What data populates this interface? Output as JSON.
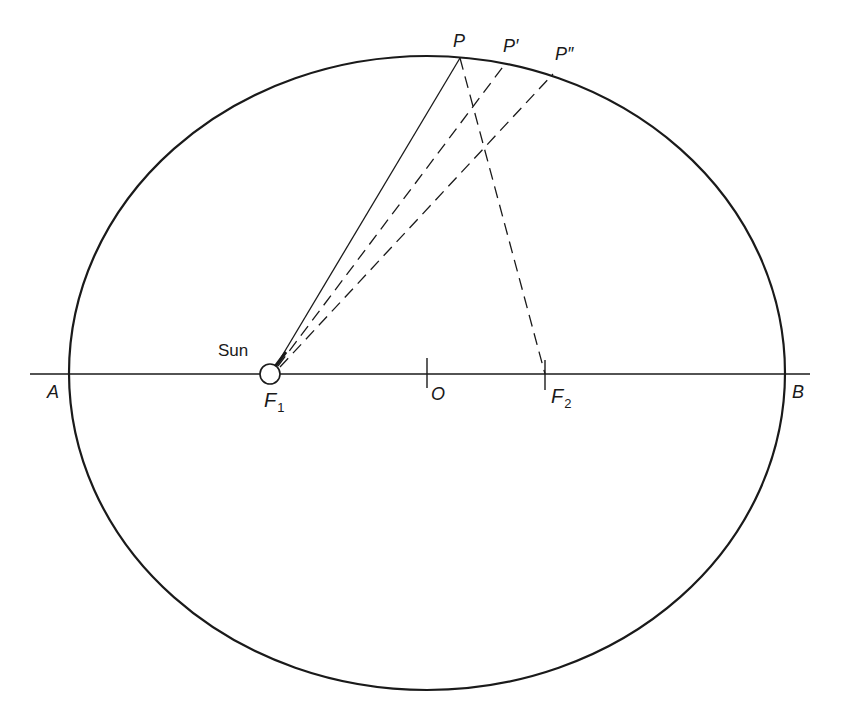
{
  "diagram": {
    "colors": {
      "line": "#1a1a1a",
      "background": "#ffffff"
    },
    "ellipse": {
      "cx": 427,
      "cy": 373,
      "rx": 358,
      "ry": 317
    },
    "axis": {
      "x1": 30,
      "x2": 810,
      "y": 374
    },
    "labels": {
      "sun": "Sun",
      "A": "A",
      "B": "B",
      "O": "O",
      "F1_main": "F",
      "F1_sub": "1",
      "F2_main": "F",
      "F2_sub": "2",
      "P": "P",
      "P1": "P′",
      "P2": "P″"
    },
    "points": {
      "F1": {
        "x": 270,
        "y": 374
      },
      "F2": {
        "x": 545,
        "y": 374
      },
      "O": {
        "x": 427,
        "y": 374
      },
      "P": {
        "x": 460,
        "y": 58
      },
      "P1": {
        "x": 505,
        "y": 64
      },
      "P2": {
        "x": 553,
        "y": 74
      }
    },
    "lines": [
      {
        "name": "F1-to-P",
        "style": "solid"
      },
      {
        "name": "F1-to-P-prime",
        "style": "dashed"
      },
      {
        "name": "F1-to-P-double-prime",
        "style": "dashed"
      },
      {
        "name": "P-to-F2",
        "style": "dashed"
      }
    ]
  }
}
